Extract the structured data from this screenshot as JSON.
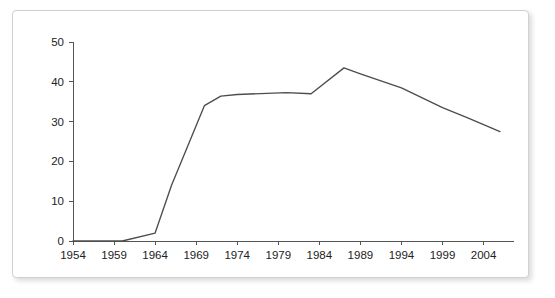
{
  "figure": {
    "frame_color": "#d0d0d0",
    "background": "#ffffff"
  },
  "chart_data": {
    "type": "line",
    "title": "",
    "subtitle": "",
    "xlabel": "",
    "ylabel": "",
    "xlim": [
      1954,
      2006
    ],
    "ylim": [
      0,
      50
    ],
    "grid": false,
    "legend": null,
    "line_color": "#4d4d4d",
    "axis_color": "#555555",
    "xticks": [
      1954,
      1959,
      1964,
      1969,
      1974,
      1979,
      1984,
      1989,
      1994,
      1999,
      2004
    ],
    "xtick_labels": [
      "1954",
      "1959",
      "1964",
      "1969",
      "1974",
      "1979",
      "1984",
      "1989",
      "1994",
      "1999",
      "2004"
    ],
    "yticks": [
      0,
      10,
      20,
      30,
      40,
      50
    ],
    "ytick_labels": [
      "0",
      "10",
      "20",
      "30",
      "40",
      "50"
    ],
    "series": [
      {
        "name": "value",
        "x": [
          1954,
          1960,
          1964,
          1966,
          1968,
          1970,
          1972,
          1974,
          1980,
          1983,
          1987,
          1989,
          1994,
          1999,
          2002,
          2006
        ],
        "values": [
          0,
          0,
          2,
          14,
          24,
          34,
          36.4,
          36.8,
          37.3,
          37.0,
          43.5,
          42.0,
          38.5,
          33.5,
          31.0,
          27.5
        ]
      }
    ]
  }
}
